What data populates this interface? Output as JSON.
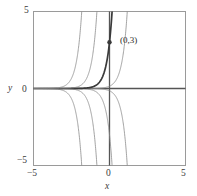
{
  "chart_data": {
    "type": "line",
    "title": "",
    "xlabel": "x",
    "ylabel": "y",
    "xlim": [
      -5,
      5
    ],
    "ylim": [
      -5,
      5
    ],
    "xticks": [
      -5,
      0,
      5
    ],
    "yticks": [
      -5,
      0,
      5
    ],
    "xtick_labels": [
      "−5",
      "0",
      "5"
    ],
    "ytick_labels": [
      "−5",
      "0",
      "5"
    ],
    "grid": false,
    "legend": "none",
    "frame": true,
    "axes_through_origin": true,
    "annotations": [
      {
        "text": "(0,3)",
        "x": 0,
        "y": 3,
        "marker": "dot"
      }
    ],
    "family_form": "y = C*e^(3x)",
    "family_constants": [
      -1200,
      -60,
      -3,
      -0.15,
      0.15,
      3,
      60,
      1200
    ],
    "highlight_constant": 3,
    "series": [
      {
        "name": "C = -1200",
        "C": -1200,
        "bold": false,
        "color": "#8c8c8c"
      },
      {
        "name": "C = -60",
        "C": -60,
        "bold": false,
        "color": "#8c8c8c"
      },
      {
        "name": "C = -3",
        "C": -3,
        "bold": false,
        "color": "#8c8c8c"
      },
      {
        "name": "C = -0.15",
        "C": -0.15,
        "bold": false,
        "color": "#8c8c8c"
      },
      {
        "name": "C = 0.15",
        "C": 0.15,
        "bold": false,
        "color": "#8c8c8c"
      },
      {
        "name": "C = 3",
        "C": 3,
        "bold": true,
        "color": "#3a3a3a"
      },
      {
        "name": "C = 60",
        "C": 60,
        "bold": false,
        "color": "#8c8c8c"
      },
      {
        "name": "C = 1200",
        "C": 1200,
        "bold": false,
        "color": "#8c8c8c"
      }
    ],
    "point": {
      "label": "(0,3)",
      "x": 0,
      "y": 3
    }
  },
  "colors": {
    "frame": "#9a9a9a",
    "axis": "#555555",
    "curve": "#8c8c8c",
    "curve_bold": "#3a3a3a",
    "text": "#3a3a3a",
    "background": "#ffffff"
  },
  "labels": {
    "x_axis": "x",
    "y_axis": "y",
    "x_min": "−5",
    "x_zero": "0",
    "x_max": "5",
    "y_min": "−5",
    "y_zero": "0",
    "y_max": "5",
    "point": "(0,3)"
  }
}
